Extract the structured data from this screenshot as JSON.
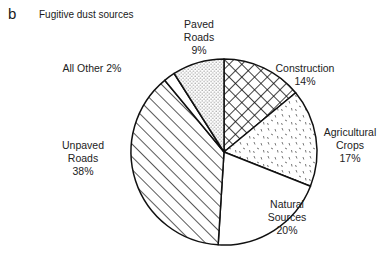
{
  "panel_letter": "b",
  "chart_data": {
    "type": "pie",
    "title": "Fugitive dust sources",
    "start": "top",
    "direction": "clockwise",
    "slices": [
      {
        "name": "Construction",
        "value": 14,
        "pattern": "crosshatch",
        "label_lines": [
          "Construction",
          "14%"
        ]
      },
      {
        "name": "Agricultural Crops",
        "value": 17,
        "pattern": "dashes",
        "label_lines": [
          "Agricultural",
          "Crops",
          "17%"
        ]
      },
      {
        "name": "Natural Sources",
        "value": 20,
        "pattern": "none",
        "label_lines": [
          "Natural",
          "Sources",
          "20%"
        ]
      },
      {
        "name": "Unpaved Roads",
        "value": 38,
        "pattern": "diagonal",
        "label_lines": [
          "Unpaved",
          "Roads",
          "38%"
        ]
      },
      {
        "name": "All Other",
        "value": 2,
        "pattern": "none",
        "label_lines": [
          "All Other 2%"
        ]
      },
      {
        "name": "Paved Roads",
        "value": 9,
        "pattern": "dots",
        "label_lines": [
          "Paved",
          "Roads",
          "9%"
        ]
      }
    ],
    "units": "%"
  }
}
